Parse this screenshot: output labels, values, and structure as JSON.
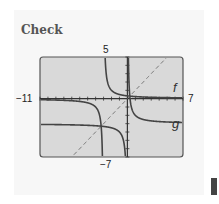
{
  "title": "Check",
  "chart_data": {
    "type": "line",
    "title": "Check",
    "xlabel": "",
    "ylabel": "",
    "xlim": [
      -11,
      7
    ],
    "ylim": [
      -7,
      5
    ],
    "tick_labels": {
      "xmin": "−11",
      "xmax": "7",
      "ymax": "5",
      "ymin": "−7"
    },
    "grid": false,
    "series": [
      {
        "name": "f",
        "expression": "1/(x+3)",
        "vertical_asymptote": -3,
        "horizontal_asymptote": 0,
        "style": "solid",
        "color": "#444444"
      },
      {
        "name": "g",
        "expression": "1/x - 3",
        "vertical_asymptote": 0,
        "horizontal_asymptote": -3,
        "style": "solid",
        "color": "#444444"
      },
      {
        "name": "y = x",
        "expression": "x",
        "style": "dashed",
        "color": "#666666"
      }
    ],
    "intersections": [
      [
        0.3,
        0.3
      ],
      [
        -3.3,
        -3.3
      ]
    ],
    "curve_labels": [
      "f",
      "g"
    ]
  }
}
